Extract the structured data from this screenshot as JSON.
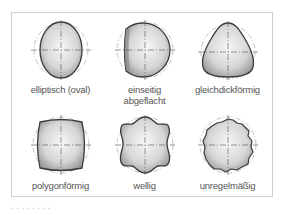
{
  "figure": {
    "shapes": [
      {
        "id": "elliptisch",
        "label": "elliptisch (oval)"
      },
      {
        "id": "einseitig",
        "label": "einseitig abgeflacht",
        "label_line1": "einseitig",
        "label_line2": "abgeflacht"
      },
      {
        "id": "gleichdick",
        "label": "gleichdickförmig"
      },
      {
        "id": "polygon",
        "label": "polygonförmig"
      },
      {
        "id": "wellig",
        "label": "wellig"
      },
      {
        "id": "unregelmaessig",
        "label": "unregelmäßig"
      }
    ],
    "colors": {
      "outline": "#3a3a3a",
      "fill_light": "#f4f4f4",
      "fill_dark": "#a8a8a8",
      "reference_circle": "#9a9a9a",
      "centerline": "#555555",
      "frame": "#cfcfcf",
      "label": "#555555"
    }
  }
}
